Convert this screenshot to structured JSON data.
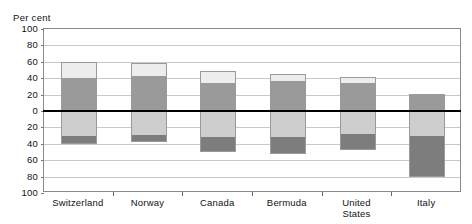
{
  "chart_data": {
    "type": "bar",
    "title": "",
    "subtitle": "",
    "xlabel": "",
    "ylabel": "Per cent",
    "ylim": [
      -100,
      100
    ],
    "grid": true,
    "legend": "none",
    "stacked": true,
    "diverging": true,
    "zero_reference_line": true,
    "ytick_labels": [
      "100",
      "80",
      "60",
      "40",
      "20",
      "0",
      "20",
      "40",
      "60",
      "80",
      "100"
    ],
    "ytick_values": [
      100,
      80,
      60,
      40,
      20,
      0,
      -20,
      -40,
      -60,
      -80,
      -100
    ],
    "categories": [
      "Switzerland",
      "Norway",
      "Canada",
      "Bermuda",
      "United States",
      "Italy"
    ],
    "series": [
      {
        "name": "positive-upper-light",
        "color": "#ededed",
        "values": [
          20,
          16,
          15,
          8,
          7,
          0
        ]
      },
      {
        "name": "positive-lower-medium",
        "color": "#9a9a9a",
        "values": [
          40,
          43,
          34,
          37,
          34,
          21
        ]
      },
      {
        "name": "negative-upper-light",
        "color": "#cecece",
        "values": [
          -30,
          -29,
          -32,
          -32,
          -28,
          -30
        ]
      },
      {
        "name": "negative-lower-dark",
        "color": "#7d7d7d",
        "values": [
          -10,
          -9,
          -18,
          -20,
          -20,
          -50
        ]
      }
    ],
    "totals_positive": [
      60,
      59,
      49,
      45,
      41,
      21
    ],
    "totals_negative": [
      -40,
      -38,
      -50,
      -52,
      -48,
      -80
    ]
  },
  "axis": {
    "y_title": "Per cent"
  },
  "xlabels": [
    "Switzerland",
    "Norway",
    "Canada",
    "Bermuda",
    "United\nStates",
    "Italy"
  ]
}
